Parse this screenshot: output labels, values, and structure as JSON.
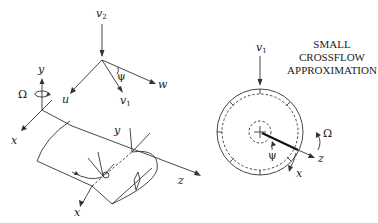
{
  "figure": {
    "left_panel": {
      "velocity_triad": {
        "labels": {
          "v2": "v",
          "v2_sub": "2",
          "v1": "v",
          "v1_sub": "1",
          "u": "u",
          "w": "w",
          "psi": "ψ"
        }
      },
      "frame_axes": {
        "labels": {
          "y": "y",
          "x": "x",
          "omega": "Ω"
        }
      },
      "cylinder": {
        "labels": {
          "y": "y",
          "z": "z",
          "x": "x"
        }
      }
    },
    "right_panel": {
      "caption_lines": [
        "SMALL",
        "CROSSFLOW",
        "APPROXIMATION"
      ],
      "labels": {
        "v1": "v",
        "v1_sub": "1",
        "omega": "Ω",
        "psi": "ψ",
        "z": "z",
        "x": "x"
      }
    }
  }
}
